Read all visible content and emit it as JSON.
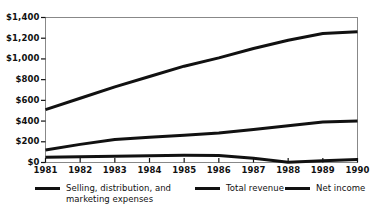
{
  "figure": {
    "title_partial": "",
    "background": "#ffffff",
    "line_color": "#111111",
    "axis_color": "#888888"
  },
  "axes": {
    "y_ticks": [
      "$1,400",
      "$1,200",
      "$1,000",
      "$800",
      "$600",
      "$400",
      "$200",
      "$0"
    ],
    "x_ticks": [
      "1981",
      "1982",
      "1983",
      "1984",
      "1985",
      "1986",
      "1987",
      "1988",
      "1989",
      "1990"
    ]
  },
  "legend": {
    "items": [
      {
        "label": "Selling, distribution, and\nmarketing expenses",
        "color": "#111111"
      },
      {
        "label": "Total revenue",
        "color": "#111111"
      },
      {
        "label": "Net income",
        "color": "#111111"
      }
    ]
  },
  "chart_data": {
    "type": "line",
    "title": "",
    "subtitle": "",
    "xlabel": "",
    "ylabel": "",
    "x": [
      1981,
      1982,
      1983,
      1984,
      1985,
      1986,
      1987,
      1988,
      1989,
      1990
    ],
    "categories": [
      "1981",
      "1982",
      "1983",
      "1984",
      "1985",
      "1986",
      "1987",
      "1988",
      "1989",
      "1990"
    ],
    "series": [
      {
        "name": "Total revenue",
        "values": [
          510,
          620,
          730,
          830,
          930,
          1010,
          1100,
          1180,
          1245,
          1262
        ]
      },
      {
        "name": "Selling, distribution, and marketing expenses",
        "values": [
          120,
          175,
          222,
          243,
          262,
          285,
          318,
          355,
          392,
          400
        ]
      },
      {
        "name": "Net income",
        "values": [
          50,
          55,
          60,
          65,
          70,
          68,
          40,
          3,
          18,
          30
        ]
      }
    ],
    "ylim": [
      0,
      1400
    ],
    "ytick_values": [
      0,
      200,
      400,
      600,
      800,
      1000,
      1200,
      1400
    ],
    "ytick_step": 200,
    "xlim": [
      1981,
      1990
    ],
    "grid": false,
    "legend_position": "bottom",
    "currency_prefix": "$",
    "units": "millions"
  }
}
